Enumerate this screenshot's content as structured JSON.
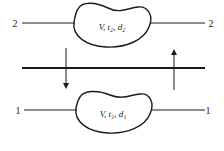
{
  "diagram": {
    "type": "two-level energy/state exchange",
    "top_state": {
      "left_label": "2",
      "right_label": "2",
      "blob_text": "V, t₂, d₂"
    },
    "bottom_state": {
      "left_label": "1",
      "right_label": "1",
      "blob_text": "V, t₁, d₁"
    },
    "middle_boundary": "thick horizontal line",
    "arrows": [
      {
        "direction": "down",
        "position": "left"
      },
      {
        "direction": "up",
        "position": "right"
      }
    ],
    "colors": {
      "stroke": "#1a1a1a",
      "background": "#ffffff"
    }
  }
}
